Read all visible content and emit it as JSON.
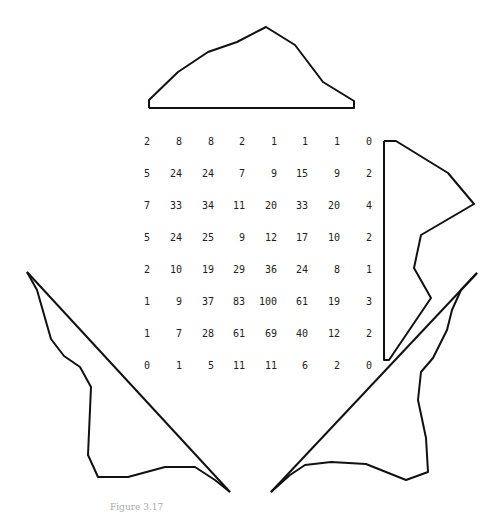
{
  "matrix": {
    "rows": [
      [
        2,
        8,
        8,
        2,
        1,
        1,
        1,
        0
      ],
      [
        5,
        24,
        24,
        7,
        9,
        15,
        9,
        2
      ],
      [
        7,
        33,
        34,
        11,
        20,
        33,
        20,
        4
      ],
      [
        5,
        24,
        25,
        9,
        12,
        17,
        10,
        2
      ],
      [
        2,
        10,
        19,
        29,
        36,
        24,
        8,
        1
      ],
      [
        1,
        9,
        37,
        83,
        100,
        61,
        19,
        3
      ],
      [
        1,
        7,
        28,
        61,
        69,
        40,
        12,
        2
      ],
      [
        0,
        1,
        5,
        11,
        11,
        6,
        2,
        0
      ]
    ]
  },
  "projections": {
    "top": "149,108 149,100 178,72 208,52 237,42 266,27 295,45 323,82 354,101 354,108 149,108",
    "right": "384,141 396,141 448,173 474,204 421,235 414,268 431,298 389,360 384,360 384,141",
    "left_curve": "27,272 37,290 51,339 64,356 80,367 91,387 88,455 98,477 128,477 165,467 195,467 215,480 230,492",
    "left_diagonal": "27,272 230,492",
    "right_curve": "477,273 461,290 452,310 447,330 433,358 421,372 418,400 426,438 428,472 406,480 366,464 331,462 305,465 290,475 271,492",
    "right_diagonal": "271,492 477,273",
    "stroke_color": "#111111"
  },
  "caption": "Figure 3.17"
}
